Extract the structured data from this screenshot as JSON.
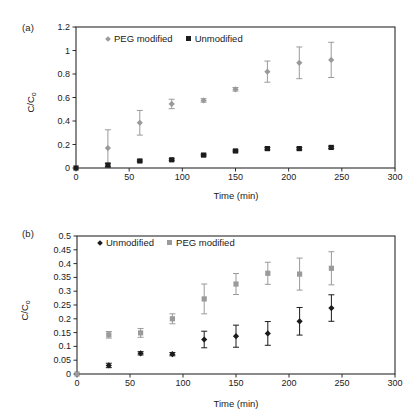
{
  "figure": {
    "panels": [
      {
        "id": "a",
        "label": "(a)",
        "xlabel": "Time (min)",
        "ylabel": "C/C",
        "ylabel_sub": "o",
        "xticks": [
          0,
          50,
          100,
          150,
          200,
          250,
          300
        ],
        "yticks": [
          "0",
          "0.2",
          "0.4",
          "0.6",
          "0.8",
          "1",
          "1.2"
        ],
        "legend": [
          {
            "name": "PEG modified",
            "marker": "diamond",
            "color": "#9a9a9a"
          },
          {
            "name": "Unmodified",
            "marker": "square",
            "color": "#1c1c1c"
          }
        ]
      },
      {
        "id": "b",
        "label": "(b)",
        "xlabel": "Time (min)",
        "ylabel": "C/C",
        "ylabel_sub": "o",
        "xticks": [
          0,
          50,
          100,
          150,
          200,
          250,
          300
        ],
        "yticks": [
          "0",
          "0.05",
          "0.1",
          "0.15",
          "0.2",
          "0.25",
          "0.3",
          "0.35",
          "0.4",
          "0.45",
          "0.5"
        ],
        "legend": [
          {
            "name": "Unmodified",
            "marker": "diamond",
            "color": "#1c1c1c"
          },
          {
            "name": "PEG modified",
            "marker": "square",
            "color": "#9a9a9a"
          }
        ]
      }
    ]
  },
  "chart_data": [
    {
      "type": "scatter",
      "panel": "a",
      "title": "(a)",
      "xlabel": "Time (min)",
      "ylabel": "C/C0",
      "xlim": [
        0,
        300
      ],
      "ylim": [
        0,
        1.2
      ],
      "xticks": [
        0,
        50,
        100,
        150,
        200,
        250,
        300
      ],
      "yticks": [
        0,
        0.2,
        0.4,
        0.6,
        0.8,
        1.0,
        1.2
      ],
      "grid": false,
      "legend_position": "top-left-inside",
      "errorbars": true,
      "series": [
        {
          "name": "PEG modified",
          "marker": "diamond",
          "color": "#9a9a9a",
          "x": [
            0,
            30,
            60,
            90,
            120,
            150,
            180,
            210,
            240
          ],
          "values": [
            0.0,
            0.17,
            0.385,
            0.545,
            0.575,
            0.67,
            0.82,
            0.895,
            0.92
          ],
          "yerr": [
            0.0,
            0.155,
            0.105,
            0.04,
            0.015,
            0.015,
            0.09,
            0.135,
            0.15
          ]
        },
        {
          "name": "Unmodified",
          "marker": "square",
          "color": "#1c1c1c",
          "x": [
            0,
            30,
            60,
            90,
            120,
            150,
            180,
            210,
            240
          ],
          "values": [
            0.0,
            0.025,
            0.06,
            0.07,
            0.11,
            0.145,
            0.165,
            0.165,
            0.175
          ],
          "yerr": [
            0.0,
            0.015,
            0.008,
            0.008,
            0.008,
            0.008,
            0.01,
            0.01,
            0.01
          ]
        }
      ]
    },
    {
      "type": "scatter",
      "panel": "b",
      "title": "(b)",
      "xlabel": "Time (min)",
      "ylabel": "C/C0",
      "xlim": [
        0,
        300
      ],
      "ylim": [
        0,
        0.5
      ],
      "xticks": [
        0,
        50,
        100,
        150,
        200,
        250,
        300
      ],
      "yticks": [
        0,
        0.05,
        0.1,
        0.15,
        0.2,
        0.25,
        0.3,
        0.35,
        0.4,
        0.45,
        0.5
      ],
      "grid": false,
      "legend_position": "top-left-inside",
      "errorbars": true,
      "series": [
        {
          "name": "Unmodified",
          "marker": "diamond",
          "color": "#1c1c1c",
          "x": [
            0,
            30,
            60,
            90,
            120,
            150,
            180,
            210,
            240
          ],
          "values": [
            0.0,
            0.031,
            0.075,
            0.072,
            0.125,
            0.137,
            0.147,
            0.191,
            0.239
          ],
          "yerr": [
            0.0,
            0.008,
            0.006,
            0.006,
            0.03,
            0.04,
            0.043,
            0.05,
            0.048
          ]
        },
        {
          "name": "PEG modified",
          "marker": "square",
          "color": "#9a9a9a",
          "x": [
            0,
            30,
            60,
            90,
            120,
            150,
            180,
            210,
            240
          ],
          "values": [
            0.0,
            0.142,
            0.149,
            0.2,
            0.272,
            0.326,
            0.365,
            0.362,
            0.383
          ],
          "yerr": [
            0.0,
            0.012,
            0.016,
            0.018,
            0.054,
            0.038,
            0.04,
            0.058,
            0.06
          ]
        }
      ]
    }
  ]
}
